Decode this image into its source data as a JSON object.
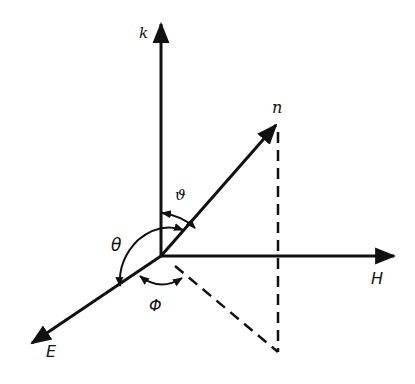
{
  "diagram": {
    "type": "3d-coordinate-vector-diagram",
    "colors": {
      "ink": "#111111",
      "background": "#ffffff"
    },
    "axes": {
      "k": {
        "label": "k"
      },
      "H": {
        "label": "H"
      },
      "E": {
        "label": "E"
      }
    },
    "vector": {
      "label": "n"
    },
    "angles": {
      "small_theta": {
        "label": "ϑ"
      },
      "big_theta": {
        "label": "θ"
      },
      "phi": {
        "label": "Φ"
      }
    }
  }
}
